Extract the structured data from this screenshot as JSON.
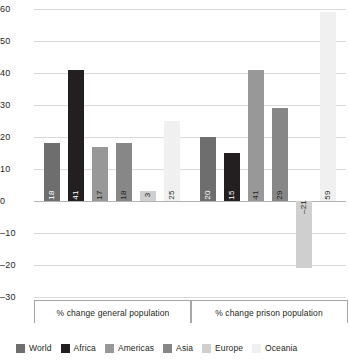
{
  "chart_data": {
    "type": "bar",
    "title": "",
    "xlabel": "",
    "ylabel": "",
    "ylim": [
      -30,
      60
    ],
    "ytick_step": 10,
    "yticks": [
      "60",
      "50",
      "40",
      "30",
      "20",
      "10",
      "0",
      "–10",
      "–20",
      "–30"
    ],
    "grid": true,
    "legend_position": "bottom",
    "categories": [
      "% change general population",
      "% change prison population"
    ],
    "series": [
      {
        "name": "World",
        "color": "#6e6e6e",
        "values": [
          18,
          20
        ]
      },
      {
        "name": "Africa",
        "color": "#231f20",
        "values": [
          41,
          15
        ]
      },
      {
        "name": "Americas",
        "color": "#989898",
        "values": [
          17,
          41
        ]
      },
      {
        "name": "Asia",
        "color": "#878787",
        "values": [
          18,
          29
        ]
      },
      {
        "name": "Europe",
        "color": "#cfcfcf",
        "values": [
          3,
          -21
        ]
      },
      {
        "name": "Oceania",
        "color": "#f0f0f0",
        "values": [
          25,
          59
        ]
      }
    ],
    "bar_labels": [
      [
        "18",
        "41",
        "17",
        "18",
        "3",
        "25"
      ],
      [
        "20",
        "15",
        "41",
        "29",
        "–21",
        "59"
      ]
    ]
  }
}
